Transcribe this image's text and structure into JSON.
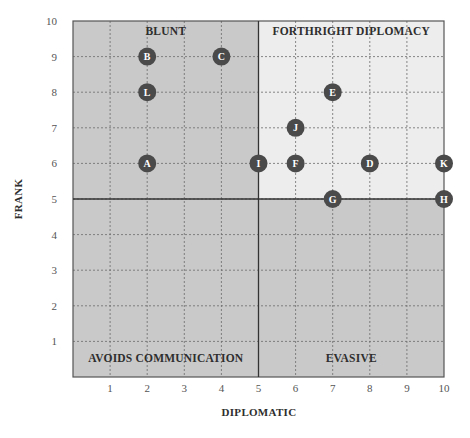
{
  "chart_data": {
    "type": "scatter",
    "title": "",
    "xlabel": "DIPLOMATIC",
    "ylabel": "FRANK",
    "xlim": [
      0,
      10
    ],
    "ylim": [
      0,
      10
    ],
    "x_ticks": [
      1,
      2,
      3,
      4,
      5,
      6,
      7,
      8,
      9,
      10
    ],
    "y_ticks": [
      1,
      2,
      3,
      4,
      5,
      6,
      7,
      8,
      9,
      10
    ],
    "grid": true,
    "legend": null,
    "quadrants": [
      {
        "label": "BLUNT",
        "x_range": [
          0,
          5
        ],
        "y_range": [
          5,
          10
        ],
        "color": "#c9c9c9"
      },
      {
        "label": "FORTHRIGHT DIPLOMACY",
        "x_range": [
          5,
          10
        ],
        "y_range": [
          5,
          10
        ],
        "color": "#ededed"
      },
      {
        "label": "AVOIDS COMMUNICATION",
        "x_range": [
          0,
          5
        ],
        "y_range": [
          0,
          5
        ],
        "color": "#c9c9c9"
      },
      {
        "label": "EVASIVE",
        "x_range": [
          5,
          10
        ],
        "y_range": [
          0,
          5
        ],
        "color": "#c9c9c9"
      }
    ],
    "points": [
      {
        "label": "A",
        "x": 2,
        "y": 6
      },
      {
        "label": "B",
        "x": 2,
        "y": 9
      },
      {
        "label": "C",
        "x": 4,
        "y": 9
      },
      {
        "label": "D",
        "x": 8,
        "y": 6
      },
      {
        "label": "E",
        "x": 7,
        "y": 8
      },
      {
        "label": "F",
        "x": 6,
        "y": 6
      },
      {
        "label": "G",
        "x": 7,
        "y": 5
      },
      {
        "label": "H",
        "x": 10,
        "y": 5
      },
      {
        "label": "I",
        "x": 5,
        "y": 6
      },
      {
        "label": "J",
        "x": 6,
        "y": 7
      },
      {
        "label": "K",
        "x": 10,
        "y": 6
      },
      {
        "label": "L",
        "x": 2,
        "y": 8
      }
    ],
    "marker_color": "#4a4a4a",
    "marker_text_color": "#ffffff"
  }
}
